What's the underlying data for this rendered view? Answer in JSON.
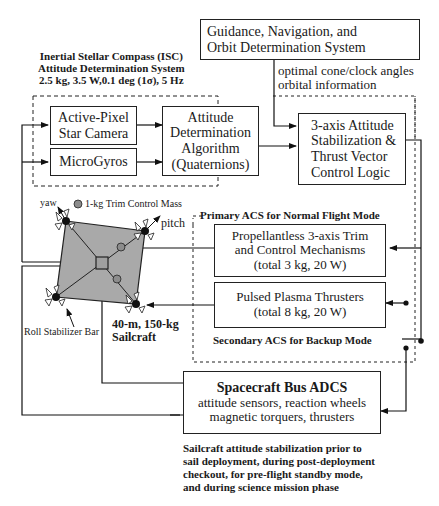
{
  "isc": {
    "title_lines": [
      "Inertial Stellar Compass (ISC)",
      "Attitude Determination System",
      "2.5 kg, 3.5 W,0.1 deg (1σ), 5 Hz"
    ],
    "star_camera": [
      "Active-Pixel",
      "Star Camera"
    ],
    "microgyros": "MicroGyros",
    "algorithm": [
      "Attitude",
      "Determination",
      "Algorithm",
      "(Quaternions)"
    ]
  },
  "gnc": {
    "box": [
      "Guidance, Navigation, and",
      "Orbit Determination System"
    ],
    "link_label": [
      "optimal cone/clock angles",
      "orbital information"
    ]
  },
  "control_logic": [
    "3-axis Attitude",
    "Stabilization &",
    "Thrust Vector",
    "Control Logic"
  ],
  "primary_acs": {
    "title": "Primary ACS for Normal Flight Mode",
    "box": [
      "Propellantless 3-axis Trim",
      "and Control Mechanisms",
      "(total 3 kg, 20 W)"
    ]
  },
  "secondary_acs": {
    "title": "Secondary ACS for Backup Mode",
    "box": [
      "Pulsed Plasma Thrusters",
      "(total 8 kg, 20 W)"
    ]
  },
  "sailcraft": {
    "yaw": "yaw",
    "pitch": "pitch",
    "trim_mass": "1-kg Trim Control Mass",
    "roll_bar": "Roll Stabilizer Bar",
    "caption": [
      "40-m, 150-kg",
      "Sailcraft"
    ],
    "sail_fill": "#a9a9a9",
    "mass_fill": "#8c8c8c"
  },
  "bus_adcs": {
    "title": "Spacecraft Bus ADCS",
    "lines": [
      "attitude sensors, reaction wheels",
      "magnetic torquers, thrusters"
    ]
  },
  "footnote": [
    "Sailcraft attitude stabilization prior to",
    "sail deployment, during post-deployment",
    "checkout,  for pre-flight standby mode,",
    "and during science mission phase"
  ]
}
